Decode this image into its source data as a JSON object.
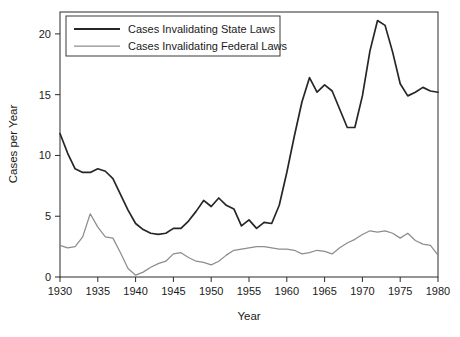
{
  "figure": {
    "title": "",
    "caption": ""
  },
  "chart_data": {
    "type": "line",
    "title": "",
    "xlabel": "Year",
    "ylabel": "Cases per Year",
    "xlim": [
      1930,
      1980
    ],
    "ylim": [
      0,
      21.8
    ],
    "grid": false,
    "legend_position": "top-left",
    "xticks": [
      1930,
      1935,
      1940,
      1945,
      1950,
      1955,
      1960,
      1965,
      1970,
      1975,
      1980
    ],
    "xtick_labels": [
      "1930",
      "1935",
      "1940",
      "1945",
      "1950",
      "1955",
      "1960",
      "1965",
      "1970",
      "1975",
      "1980"
    ],
    "yticks": [
      0,
      5,
      10,
      15,
      20
    ],
    "ytick_labels": [
      "0",
      "5",
      "10",
      "15",
      "20"
    ],
    "x": [
      1930,
      1931,
      1932,
      1933,
      1934,
      1935,
      1936,
      1937,
      1938,
      1939,
      1940,
      1941,
      1942,
      1943,
      1944,
      1945,
      1946,
      1947,
      1948,
      1949,
      1950,
      1951,
      1952,
      1953,
      1954,
      1955,
      1956,
      1957,
      1958,
      1959,
      1960,
      1961,
      1962,
      1963,
      1964,
      1965,
      1966,
      1967,
      1968,
      1969,
      1970,
      1971,
      1972,
      1973,
      1974,
      1975,
      1976,
      1977,
      1978,
      1979,
      1980
    ],
    "series": [
      {
        "name": "Cases Invalidating State Laws",
        "color": "#262626",
        "width": 1.7,
        "values": [
          11.8,
          10.2,
          8.9,
          8.6,
          8.6,
          8.9,
          8.7,
          8.1,
          6.8,
          5.5,
          4.4,
          3.9,
          3.6,
          3.5,
          3.6,
          4.0,
          4.0,
          4.6,
          5.4,
          6.3,
          5.8,
          6.5,
          5.9,
          5.6,
          4.2,
          4.7,
          4.0,
          4.5,
          4.4,
          5.9,
          8.6,
          11.6,
          14.4,
          16.4,
          15.2,
          15.8,
          15.3,
          13.8,
          12.3,
          12.3,
          14.9,
          18.6,
          21.1,
          20.7,
          18.5,
          15.9,
          14.9,
          15.2,
          15.6,
          15.3,
          15.2
        ]
      },
      {
        "name": "Cases Invalidating Federal Laws",
        "color": "#8d8d8d",
        "width": 1.25,
        "values": [
          2.6,
          2.4,
          2.5,
          3.3,
          5.2,
          4.1,
          3.3,
          3.2,
          2.0,
          0.7,
          0.15,
          0.4,
          0.8,
          1.1,
          1.3,
          1.9,
          2.0,
          1.6,
          1.3,
          1.2,
          1.0,
          1.3,
          1.8,
          2.2,
          2.3,
          2.4,
          2.5,
          2.5,
          2.4,
          2.3,
          2.3,
          2.2,
          1.9,
          2.0,
          2.2,
          2.1,
          1.9,
          2.4,
          2.8,
          3.1,
          3.5,
          3.8,
          3.7,
          3.8,
          3.6,
          3.2,
          3.6,
          3.0,
          2.7,
          2.6,
          1.8
        ]
      }
    ]
  },
  "legend": {
    "items": [
      {
        "label": "Cases Invalidating State Laws",
        "color": "#262626"
      },
      {
        "label": "Cases Invalidating Federal Laws",
        "color": "#8d8d8d"
      }
    ]
  }
}
